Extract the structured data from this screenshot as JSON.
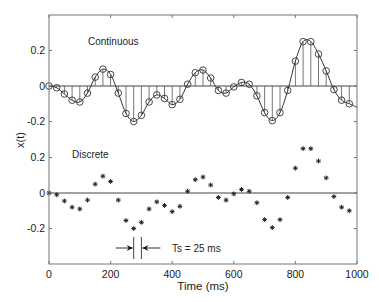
{
  "chart_data": {
    "type": "line",
    "title": "",
    "xlabel": "Time (ms)",
    "ylabel": "x(t)",
    "xlim": [
      0,
      1000
    ],
    "x_ticks": [
      0,
      200,
      400,
      600,
      800,
      1000
    ],
    "x_tick_labels": [
      "0",
      "200",
      "400",
      "600",
      "800",
      "1000"
    ],
    "panels": [
      {
        "name": "continuous",
        "label": "Continuous",
        "y_ticks": [
          0.2,
          0,
          -0.2
        ],
        "y_tick_labels": [
          "0.2",
          "0",
          "-0.2"
        ],
        "style": "line-with-stems-and-circles"
      },
      {
        "name": "discrete",
        "label": "Discrete",
        "y_ticks": [
          0.2,
          0,
          -0.2
        ],
        "y_tick_labels": [
          "0.2",
          "0",
          "-0.2"
        ],
        "style": "asterisk-markers"
      }
    ],
    "x": [
      0,
      25,
      50,
      75,
      100,
      125,
      150,
      175,
      200,
      225,
      250,
      275,
      300,
      325,
      350,
      375,
      400,
      425,
      450,
      475,
      500,
      525,
      550,
      575,
      600,
      625,
      650,
      675,
      700,
      725,
      750,
      775,
      800,
      825,
      850,
      875,
      900,
      925,
      950,
      975
    ],
    "series": [
      {
        "name": "x(t) samples",
        "values": [
          0,
          -0.01,
          -0.045,
          -0.08,
          -0.09,
          -0.04,
          0.05,
          0.095,
          0.065,
          -0.04,
          -0.155,
          -0.2,
          -0.165,
          -0.09,
          -0.05,
          -0.07,
          -0.105,
          -0.075,
          0.01,
          0.075,
          0.09,
          0.045,
          -0.025,
          -0.04,
          -0.005,
          0.02,
          0.01,
          -0.055,
          -0.15,
          -0.195,
          -0.15,
          -0.025,
          0.14,
          0.25,
          0.25,
          0.18,
          0.085,
          -0.02,
          -0.08,
          -0.1
        ]
      }
    ],
    "continuous_end_value": -0.12,
    "annotation": {
      "text": "Ts = 25 ms",
      "between_x": [
        275,
        300
      ]
    },
    "grid": false,
    "legend": "none"
  }
}
